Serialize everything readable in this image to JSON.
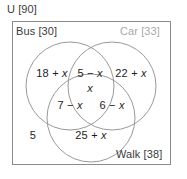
{
  "figure": {
    "type": "venn-diagram-3set",
    "universe": {
      "label": "U [90]",
      "name": "U",
      "total": 90
    },
    "sets": [
      {
        "key": "bus",
        "label": "Bus [30]",
        "name": "Bus",
        "total": 30,
        "color": "#3b3b3b"
      },
      {
        "key": "car",
        "label": "Car [33]",
        "name": "Car",
        "total": 33,
        "color": "#a8a8a8"
      },
      {
        "key": "walk",
        "label": "Walk [38]",
        "name": "Walk",
        "total": 38,
        "color": "#3b3b3b"
      }
    ],
    "regions": {
      "bus_only": "18 + x",
      "bus_car": "5 − x",
      "car_only": "22 + x",
      "bus_car_walk": "x",
      "bus_walk": "7 − x",
      "car_walk": "6 − x",
      "walk_only": "25 + x",
      "outside_all": "5"
    },
    "style": {
      "circle_stroke": "#999999",
      "box_stroke": "#8c8c8c",
      "text_color": "#1d1d1d",
      "background": "#ffffff"
    }
  }
}
